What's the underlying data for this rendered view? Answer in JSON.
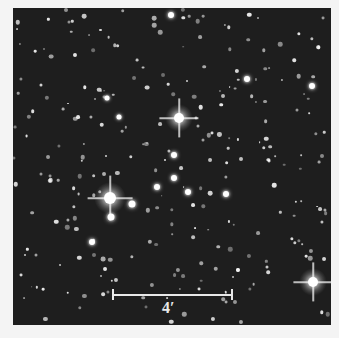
{
  "image": {
    "description": "Star cluster field, grayscale astronomical image",
    "background_color": "#1e1e1e",
    "frame_color": "#f4f4f4"
  },
  "scale_bar": {
    "label": "4′",
    "color": "#e8e8e8"
  },
  "bright_stars": [
    {
      "x": 179,
      "y": 118,
      "r": 5,
      "halo": 28
    },
    {
      "x": 110,
      "y": 198,
      "r": 6,
      "halo": 32
    },
    {
      "x": 313,
      "y": 282,
      "r": 5,
      "halo": 28
    },
    {
      "x": 171,
      "y": 15,
      "r": 3,
      "halo": 10
    },
    {
      "x": 111,
      "y": 217,
      "r": 3.5,
      "halo": 12
    },
    {
      "x": 132,
      "y": 204,
      "r": 3.5,
      "halo": 12
    },
    {
      "x": 157,
      "y": 187,
      "r": 3,
      "halo": 10
    },
    {
      "x": 174,
      "y": 178,
      "r": 3,
      "halo": 10
    },
    {
      "x": 188,
      "y": 192,
      "r": 3,
      "halo": 10
    },
    {
      "x": 226,
      "y": 194,
      "r": 3,
      "halo": 10
    },
    {
      "x": 247,
      "y": 79,
      "r": 3,
      "halo": 10
    },
    {
      "x": 312,
      "y": 86,
      "r": 3,
      "halo": 10
    },
    {
      "x": 174,
      "y": 155,
      "r": 3,
      "halo": 10
    },
    {
      "x": 92,
      "y": 242,
      "r": 3,
      "halo": 10
    },
    {
      "x": 119,
      "y": 117,
      "r": 2.5,
      "halo": 8
    },
    {
      "x": 107,
      "y": 98,
      "r": 2.5,
      "halo": 8
    }
  ]
}
